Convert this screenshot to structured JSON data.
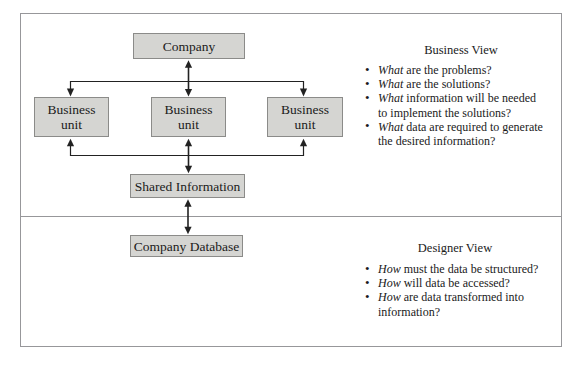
{
  "diagram": {
    "nodes": {
      "company": "Company",
      "business_unit": {
        "line1": "Business",
        "line2": "unit"
      },
      "shared_information": "Shared Information",
      "company_database": "Company Database"
    },
    "colors": {
      "box_fill": "#d5d5d2",
      "box_border": "#8b8b89",
      "line": "#222222",
      "frame_border": "#97979a"
    }
  },
  "business_view": {
    "title": "Business View",
    "bullets": [
      {
        "lead": "What",
        "line1": " are the problems?"
      },
      {
        "lead": "What",
        "line1": " are the solutions?"
      },
      {
        "lead": "What",
        "line1": " information will be needed",
        "line2": "to implement the solutions?"
      },
      {
        "lead": "What",
        "line1": " data are required to generate",
        "line2": "the desired information?"
      }
    ]
  },
  "designer_view": {
    "title": "Designer View",
    "bullets": [
      {
        "lead": "How",
        "line1": " must the data be structured?"
      },
      {
        "lead": "How",
        "line1": " will data be accessed?"
      },
      {
        "lead": "How",
        "line1": " are data transformed into",
        "line2": "information?"
      }
    ]
  }
}
